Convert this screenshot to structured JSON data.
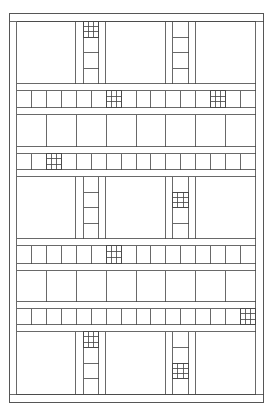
{
  "diagram": {
    "kind": "grid-pattern",
    "colors": {
      "line": "#444444",
      "background": "#ffffff"
    },
    "sections": [
      {
        "ladders": [
          {
            "column": "left",
            "grid_at_cell": 0,
            "rungs": 3
          },
          {
            "column": "right",
            "grid_at_cell": -1,
            "rungs": 3
          }
        ]
      },
      {
        "ladders": [
          {
            "column": "left",
            "grid_at_cell": -1,
            "rungs": 3
          },
          {
            "column": "right",
            "grid_at_cell": 1,
            "rungs": 3
          }
        ]
      },
      {
        "ladders": [
          {
            "column": "left",
            "grid_at_cell": 0,
            "rungs": 3
          },
          {
            "column": "right",
            "grid_at_cell": 2,
            "rungs": 3
          }
        ]
      }
    ],
    "strips": [
      {
        "cells": 16,
        "grid_cells": [
          6,
          13
        ]
      },
      {
        "cells": 16,
        "grid_cells": [
          2
        ]
      },
      {
        "cells": 16,
        "grid_cells": [
          6
        ]
      },
      {
        "cells": 16,
        "grid_cells": [
          15
        ]
      }
    ],
    "block_rows": [
      {
        "blocks": 8
      },
      {
        "blocks": 8
      }
    ]
  }
}
